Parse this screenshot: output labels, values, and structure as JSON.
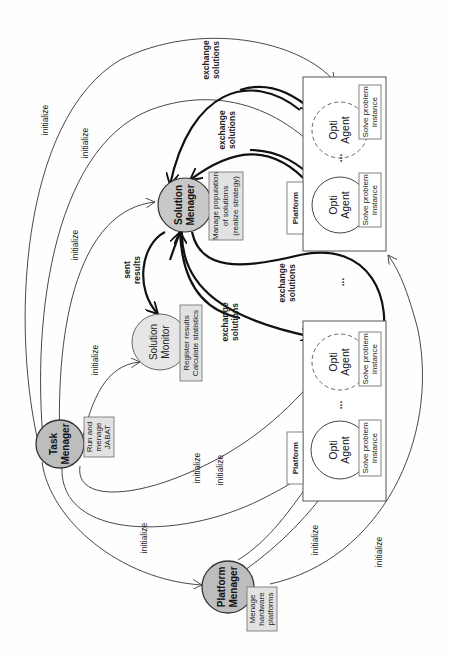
{
  "diagram": {
    "orientation": "rotated-90-ccw",
    "colors": {
      "manager_fill": "#bdbdbd",
      "monitor_fill": "#e6e6e6",
      "note_fill": "#e2e2e2",
      "agent_fill": "#ffffff",
      "edge": "#222222"
    },
    "nodes": {
      "task_manager": {
        "title_line1": "Task",
        "title_line2": "Menager",
        "note_line1": "Run and",
        "note_line2": "menage",
        "note_line3": "JABAT"
      },
      "platform_manager": {
        "title_line1": "Platform",
        "title_line2": "Menager",
        "note_line1": "Menage",
        "note_line2": "hardware",
        "note_line3": "platforms"
      },
      "solution_monitor": {
        "title_line1": "Solution",
        "title_line2": "Monitor",
        "note_line1": "Register results",
        "note_line2": "Calculate statistics"
      },
      "solution_manager": {
        "title_line1": "Solution",
        "title_line2": "Menager",
        "note_line1": "Manage population",
        "note_line2": "of solutions",
        "note_line3": "(realize strategy)"
      }
    },
    "platforms": [
      {
        "label": "Platform",
        "agents": [
          {
            "title_line1": "Opti",
            "title_line2": "Agent",
            "style": "solid",
            "note_line1": "Solve problem",
            "note_line2": "instance"
          },
          {
            "title_line1": "Opti",
            "title_line2": "Agent",
            "style": "dashed",
            "note_line1": "Solve problem",
            "note_line2": "instance"
          }
        ],
        "ellipsis": "..."
      },
      {
        "label": "Platform",
        "agents": [
          {
            "title_line1": "Opti",
            "title_line2": "Agent",
            "style": "solid",
            "note_line1": "Solve problem",
            "note_line2": "instance"
          },
          {
            "title_line1": "Opti",
            "title_line2": "Agent",
            "style": "dashed",
            "note_line1": "Solve problem",
            "note_line2": "instance"
          }
        ],
        "ellipsis": "..."
      }
    ],
    "between_platforms_ellipsis": "...",
    "edge_labels": {
      "initialize": "initialize",
      "exchange_line1": "exchange",
      "exchange_line2": "solutions",
      "sent_line1": "sent",
      "sent_line2": "results"
    }
  }
}
